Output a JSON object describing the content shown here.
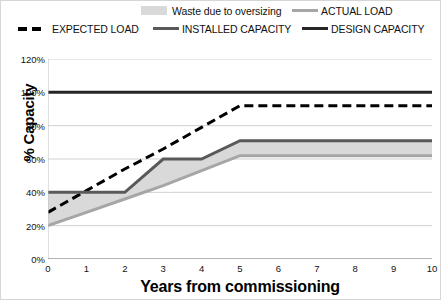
{
  "legend": {
    "items": [
      {
        "label": "Waste due to oversizing",
        "style": "fill",
        "color": "#d9d9d9",
        "name": "legend-waste-due-to-oversizing"
      },
      {
        "label": "ACTUAL LOAD",
        "style": "line",
        "color": "#a6a6a6",
        "name": "legend-actual-load"
      },
      {
        "label": "EXPECTED LOAD",
        "style": "dashed",
        "color": "#000000",
        "name": "legend-expected-load"
      },
      {
        "label": "INSTALLED CAPACITY",
        "style": "line",
        "color": "#595959",
        "name": "legend-installed-capacity"
      },
      {
        "label": "DESIGN CAPACITY",
        "style": "line",
        "color": "#262626",
        "name": "legend-design-capacity"
      }
    ]
  },
  "chart_data": {
    "type": "line",
    "title": "",
    "xlabel": "Years from commissioning",
    "ylabel": "% Capacity",
    "x": [
      0,
      1,
      2,
      3,
      4,
      5,
      6,
      7,
      8,
      9,
      10
    ],
    "xlim": [
      0,
      10
    ],
    "ylim": [
      0,
      120
    ],
    "xticks": [
      "0",
      "1",
      "2",
      "3",
      "4",
      "5",
      "6",
      "7",
      "8",
      "9",
      "10"
    ],
    "yticks": [
      "0%",
      "20%",
      "40%",
      "60%",
      "80%",
      "100%",
      "120%"
    ],
    "ytick_values": [
      0,
      20,
      40,
      60,
      80,
      100,
      120
    ],
    "grid": true,
    "legend_position": "top",
    "series": [
      {
        "name": "DESIGN CAPACITY",
        "color": "#262626",
        "style": "solid",
        "width": 3,
        "values": [
          100,
          100,
          100,
          100,
          100,
          100,
          100,
          100,
          100,
          100,
          100
        ]
      },
      {
        "name": "EXPECTED LOAD",
        "color": "#000000",
        "style": "dashed",
        "width": 3,
        "values": [
          28,
          41,
          54,
          66,
          79,
          92,
          92,
          92,
          92,
          92,
          92
        ]
      },
      {
        "name": "INSTALLED CAPACITY",
        "color": "#595959",
        "style": "solid",
        "width": 3,
        "values": [
          40,
          40,
          40,
          60,
          60,
          71,
          71,
          71,
          71,
          71,
          71
        ]
      },
      {
        "name": "ACTUAL LOAD",
        "color": "#a6a6a6",
        "style": "solid",
        "width": 3,
        "values": [
          20,
          28,
          36,
          44,
          53,
          62,
          62,
          62,
          62,
          62,
          62
        ]
      }
    ],
    "band": {
      "name": "Waste due to oversizing",
      "color": "#d9d9d9",
      "upper_series": "INSTALLED CAPACITY",
      "lower_series": "ACTUAL LOAD"
    }
  }
}
